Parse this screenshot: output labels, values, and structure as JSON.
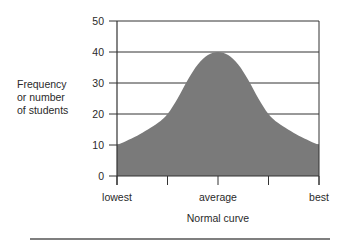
{
  "chart_data": {
    "type": "area",
    "title": "",
    "xlabel": "Normal curve",
    "ylabel": "Frequency or number of students",
    "ylabel_lines": [
      "Frequency",
      "or number",
      "of students"
    ],
    "categories": [
      "lowest",
      "",
      "average",
      "",
      "best"
    ],
    "x_tick_labels": [
      "lowest",
      "average",
      "best"
    ],
    "y_ticks": [
      0,
      10,
      20,
      30,
      40,
      50
    ],
    "ylim": [
      0,
      50
    ],
    "grid": true,
    "legend": null,
    "series": [
      {
        "name": "Normal curve",
        "x": [
          0,
          0.1,
          0.2,
          0.25,
          0.3,
          0.35,
          0.4,
          0.45,
          0.5,
          0.55,
          0.6,
          0.65,
          0.7,
          0.75,
          0.8,
          0.9,
          1.0
        ],
        "values": [
          10,
          13,
          17,
          20,
          25,
          31,
          36,
          39,
          40,
          39,
          36,
          31,
          25,
          20,
          17,
          13,
          10
        ],
        "fill": "#7a7a7a"
      }
    ]
  },
  "colors": {
    "fill": "#7a7a7a",
    "grid": "#333333",
    "text": "#2a2a2a"
  }
}
